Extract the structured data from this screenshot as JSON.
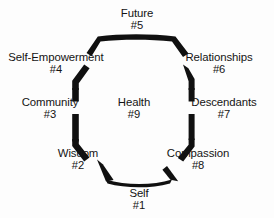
{
  "diagram": {
    "shape": "nonagon-ring",
    "stroke_color": "#101010",
    "background_color": "#fdfdfd",
    "center": {
      "label": "Health",
      "number": "#9"
    },
    "nodes": [
      {
        "id": "self",
        "label": "Self",
        "number": "#1",
        "position": "bottom"
      },
      {
        "id": "wisdom",
        "label": "Wisdom",
        "number": "#2",
        "position": "bottom-left"
      },
      {
        "id": "community",
        "label": "Community",
        "number": "#3",
        "position": "left"
      },
      {
        "id": "self-empowerment",
        "label": "Self-Empowerment",
        "number": "#4",
        "position": "upper-left"
      },
      {
        "id": "future",
        "label": "Future",
        "number": "#5",
        "position": "top"
      },
      {
        "id": "relationships",
        "label": "Relationships",
        "number": "#6",
        "position": "upper-right"
      },
      {
        "id": "descendants",
        "label": "Descendants",
        "number": "#7",
        "position": "right"
      },
      {
        "id": "compassion",
        "label": "Compassion",
        "number": "#8",
        "position": "bottom-right"
      }
    ]
  }
}
